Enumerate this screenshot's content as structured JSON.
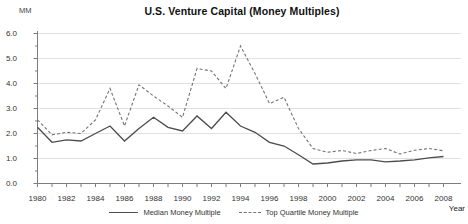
{
  "chart": {
    "title": "U.S. Venture Capital (Money Multiples)",
    "y_unit_label": "MM",
    "x_axis_title": "Year",
    "legend": {
      "median_label": "Median Money Multiple",
      "top_quartile_label": "Top Quartile Money Multiple"
    },
    "colors": {
      "median_line": "#4d4d4d",
      "top_quartile_line": "#737373",
      "gridline": "#d9d9d9",
      "axis": "#7d7d7d",
      "tick_text": "#333333"
    }
  },
  "chart_data": {
    "type": "line",
    "title": "U.S. Venture Capital (Money Multiples)",
    "xlabel": "Year",
    "ylabel": "MM",
    "x": [
      1980,
      1981,
      1982,
      1983,
      1984,
      1985,
      1986,
      1987,
      1988,
      1989,
      1990,
      1991,
      1992,
      1993,
      1994,
      1995,
      1996,
      1997,
      1998,
      1999,
      2000,
      2001,
      2002,
      2003,
      2004,
      2005,
      2006,
      2007,
      2008
    ],
    "series": [
      {
        "name": "Median Money Multiple",
        "style": "solid",
        "values": [
          2.25,
          1.65,
          1.75,
          1.7,
          2.0,
          2.3,
          1.7,
          2.2,
          2.65,
          2.25,
          2.1,
          2.7,
          2.2,
          2.85,
          2.3,
          2.05,
          1.65,
          1.5,
          1.15,
          0.78,
          0.82,
          0.9,
          0.95,
          0.95,
          0.87,
          0.9,
          0.95,
          1.03,
          1.08
        ]
      },
      {
        "name": "Top Quartile Money Multiple",
        "style": "dashed",
        "values": [
          2.55,
          1.95,
          2.05,
          2.0,
          2.55,
          3.8,
          2.3,
          3.95,
          3.5,
          3.1,
          2.65,
          4.6,
          4.5,
          3.8,
          5.5,
          4.4,
          3.2,
          3.45,
          2.2,
          1.4,
          1.25,
          1.32,
          1.2,
          1.32,
          1.4,
          1.18,
          1.33,
          1.4,
          1.31
        ]
      }
    ],
    "ylim": [
      0,
      6
    ],
    "ytick_step": 1.0,
    "ytick_minor_step": 0.5,
    "xtick_label_step": 2,
    "grid": true,
    "legend_position": "bottom"
  }
}
